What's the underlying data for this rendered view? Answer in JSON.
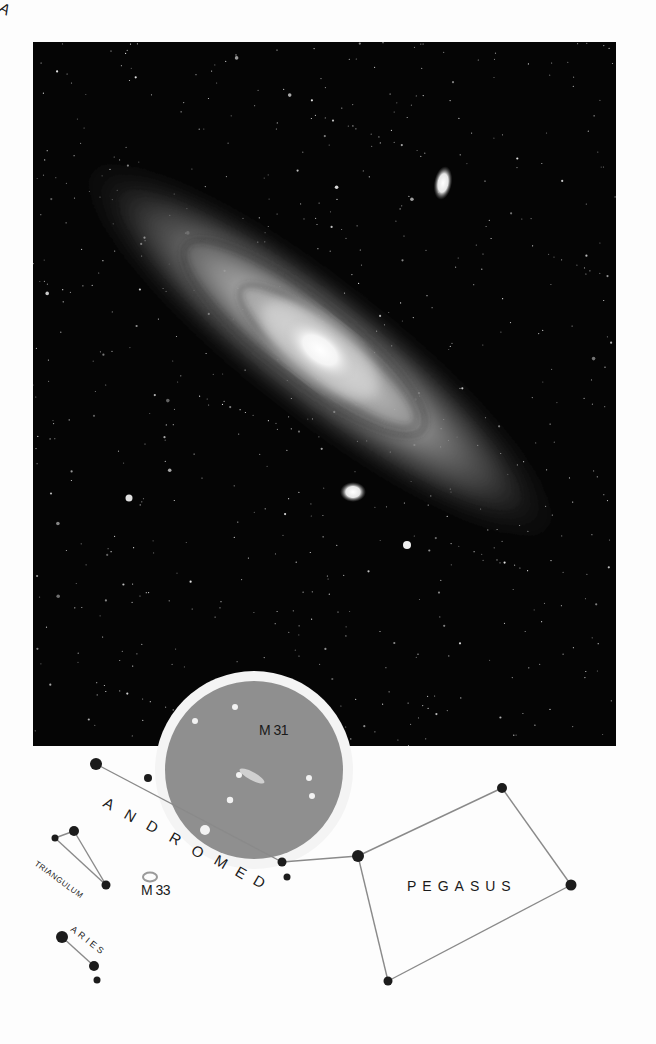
{
  "figure": {
    "photo": {
      "background": "#050505",
      "galaxy_main": {
        "name": "M 31",
        "center": [
          287,
          308
        ],
        "rotation_deg": 38
      },
      "companion_upper": {
        "center": [
          410,
          141
        ]
      },
      "companion_lower": {
        "center": [
          320,
          450
        ]
      }
    },
    "finder_circle": {
      "center": [
        254,
        770
      ],
      "radius": 89,
      "ring_radius": 99,
      "fill": "#8f8f8f",
      "ring": "#f4f4f4"
    },
    "labels": {
      "m31": "M 31",
      "m33": "M 33",
      "andromeda": "ANDROMEDA",
      "pegasus": "PEGASUS",
      "triangulum": "TRIANGULUM",
      "aries": "ARIES"
    },
    "colors": {
      "star": "#1c1c1c",
      "line": "#8a8a8a",
      "text": "#1a1a1a"
    }
  }
}
